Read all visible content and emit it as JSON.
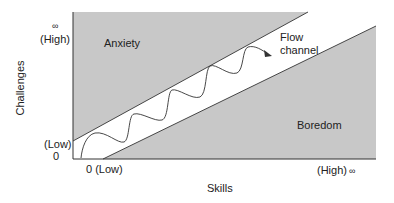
{
  "diagram": {
    "axes": {
      "x_label": "Skills",
      "y_label": "Challenges",
      "x_min_label": "0 (Low)",
      "x_max_label": "(High)",
      "x_max_symbol": "∞",
      "y_min_label": "(Low)",
      "y_min_value": "0",
      "y_max_label": "(High)",
      "y_max_symbol": "∞"
    },
    "regions": {
      "anxiety": "Anxiety",
      "boredom": "Boredom",
      "flow": "Flow",
      "flow_line2": "channel"
    },
    "colors": {
      "region_fill": "#c8c8c8",
      "line": "#333333",
      "background": "#ffffff"
    }
  }
}
